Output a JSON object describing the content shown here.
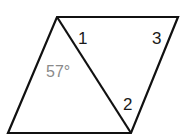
{
  "diagram": {
    "shape": "parallelogram",
    "vertices": {
      "top_left": [
        57,
        17
      ],
      "top_right": [
        178,
        17
      ],
      "bottom_right": [
        131,
        133
      ],
      "bottom_left": [
        8,
        133
      ]
    },
    "diagonal": {
      "from": "top_left",
      "to": "bottom_right"
    },
    "labels": {
      "angle1": "1",
      "angle2": "2",
      "angle3": "3",
      "given_angle": "57°"
    },
    "colors": {
      "stroke": "#111111",
      "given_angle_text": "#8a8a8a"
    }
  }
}
